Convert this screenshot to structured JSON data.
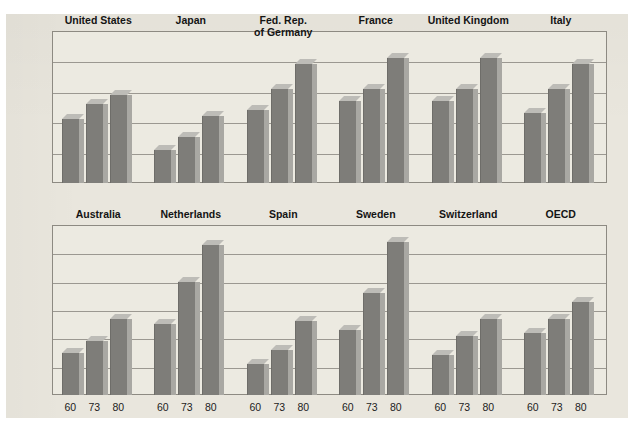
{
  "figure": {
    "ghost_caption_text": "",
    "bar_color": "#7e7d79",
    "bar_side_color": "#a9a8a3",
    "bar_top_color": "#bdbcb7",
    "paper_color": "#e9e6dd",
    "plot_bg_color": "#eceae1",
    "axis_color": "#8d8a82"
  },
  "chart_data": [
    {
      "type": "bar",
      "title": "",
      "panel": "top",
      "xlabel": "",
      "ylabel": "",
      "ylim": [
        0,
        50
      ],
      "yunit": "%",
      "ytop_label": "50%",
      "yticks": [
        0,
        10,
        20,
        30,
        40
      ],
      "ytick_labels": [
        "0",
        "10",
        "20",
        "30",
        "40"
      ],
      "grid": true,
      "legend": "none",
      "categories": [
        "1960",
        "1973",
        "1980"
      ],
      "category_tick_labels": [
        "60",
        "73",
        "80"
      ],
      "groups": [
        {
          "label": "United States",
          "values": [
            21,
            26,
            29
          ]
        },
        {
          "label": "Japan",
          "values": [
            11,
            15,
            22
          ]
        },
        {
          "label": "Fed. Rep.\nof Germany",
          "values": [
            24,
            31,
            39
          ]
        },
        {
          "label": "France",
          "values": [
            27,
            31,
            41
          ]
        },
        {
          "label": "United Kingdom",
          "values": [
            27,
            31,
            41
          ]
        },
        {
          "label": "Italy",
          "values": [
            23,
            31,
            39
          ]
        }
      ]
    },
    {
      "type": "bar",
      "title": "",
      "panel": "bottom",
      "xlabel": "",
      "ylabel": "",
      "ylim": [
        0,
        60
      ],
      "yunit": "%",
      "ytop_label": "60%",
      "yticks": [
        0,
        10,
        20,
        30,
        40,
        50
      ],
      "ytick_labels": [
        "0",
        "10",
        "20",
        "30",
        "40",
        "50"
      ],
      "grid": true,
      "legend": "none",
      "categories": [
        "1960",
        "1973",
        "1980"
      ],
      "category_tick_labels": [
        "60",
        "73",
        "80"
      ],
      "groups": [
        {
          "label": "Australia",
          "values": [
            15,
            19,
            27
          ]
        },
        {
          "label": "Netherlands",
          "values": [
            25,
            40,
            53
          ]
        },
        {
          "label": "Spain",
          "values": [
            11,
            16,
            26
          ]
        },
        {
          "label": "Sweden",
          "values": [
            23,
            36,
            54
          ]
        },
        {
          "label": "Switzerland",
          "values": [
            14,
            21,
            27
          ]
        },
        {
          "label": "OECD",
          "values": [
            22,
            27,
            33
          ]
        }
      ]
    }
  ]
}
